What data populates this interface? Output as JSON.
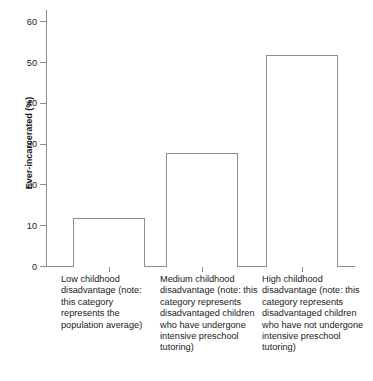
{
  "chart_data": {
    "type": "bar",
    "title": "",
    "xlabel": "",
    "ylabel": "Ever-incarcerated (%)",
    "categories": [
      "Low childhood disadvantage (note: this category represents the population average)",
      "Medium childhood disadvantage (note: this category represents disadvantaged children who have undergone intensive preschool tutoring)",
      "High childhood disadvantage (note: this category represents disadvantaged children who have not undergone intensive preschool tutoring)"
    ],
    "values": [
      12,
      28,
      52
    ],
    "ylim": [
      0,
      63
    ],
    "yticks": [
      0,
      10,
      20,
      30,
      40,
      50,
      60
    ],
    "ytick_labels": [
      "0",
      "10",
      "20",
      "30",
      "40",
      "50",
      "60"
    ],
    "grid": false,
    "legend": false,
    "bar_fill_color": "#ffffff",
    "bar_border_color": "#8c8c8c",
    "axis_color": "#8c8c8c",
    "text_color": "#1a1a1a",
    "background_color": "#ffffff"
  }
}
